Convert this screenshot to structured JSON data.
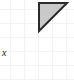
{
  "figure": {
    "width": 74,
    "height": 80,
    "background_color": "#ffffff",
    "grid": {
      "visible": true,
      "color": "#f2f2f2",
      "cell_size": 14
    },
    "labels": [
      {
        "name": "x-label",
        "text": "x",
        "style": "italic-serif",
        "color": "#1a1a1a",
        "x": 2,
        "y": 48
      }
    ],
    "shapes": [
      {
        "name": "right-triangle",
        "type": "polygon",
        "fill_color": "#c9c9c9",
        "stroke_color": "#2b2b2b",
        "stroke_width": 2,
        "right_angle_at": "top-left",
        "points": [
          {
            "x": 39,
            "y": 3
          },
          {
            "x": 67,
            "y": 3
          },
          {
            "x": 39,
            "y": 31
          }
        ]
      }
    ]
  }
}
